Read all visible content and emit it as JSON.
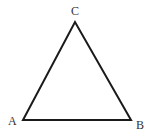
{
  "diagram": {
    "type": "triangle",
    "stroke_color": "#1a1a1a",
    "vertices": [
      {
        "label": "A",
        "x": 23,
        "y": 120
      },
      {
        "label": "B",
        "x": 131,
        "y": 120
      },
      {
        "label": "C",
        "x": 75,
        "y": 22
      }
    ]
  }
}
